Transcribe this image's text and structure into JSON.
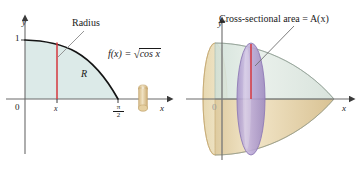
{
  "figure": {
    "panels": [
      {
        "id": "left",
        "name": "region-plot",
        "axes": {
          "y_label": "y",
          "x_label": "x",
          "origin_label": "0",
          "y_tick_label": "1",
          "x_tick_label": "x",
          "x_end_num": "π",
          "x_end_den": "2"
        },
        "annotations": {
          "radius_label": "Radius",
          "region_label": "R",
          "function_prefix": "f(x) = ",
          "function_radical": "√",
          "function_radicand": "cos x"
        },
        "colors": {
          "region_fill": "#dceae8",
          "curve": "#141414",
          "radius_line": "#d4373e",
          "axis": "#6b6b6b",
          "disk": "#e2c99a"
        }
      },
      {
        "id": "right",
        "name": "solid-of-revolution-plot",
        "axes": {
          "y_label": "y",
          "x_label": "x",
          "origin_label": "0"
        },
        "annotations": {
          "cross_section_label": "Cross-sectional area = A(x)"
        },
        "colors": {
          "solid_top": "#dfe9e3",
          "solid_bottom": "#e8d5a8",
          "cross_section": "#b9a7d4",
          "cross_section_edge": "#8e7ab5",
          "radius_line": "#d4373e",
          "axis": "#6b6b6b"
        }
      }
    ]
  }
}
